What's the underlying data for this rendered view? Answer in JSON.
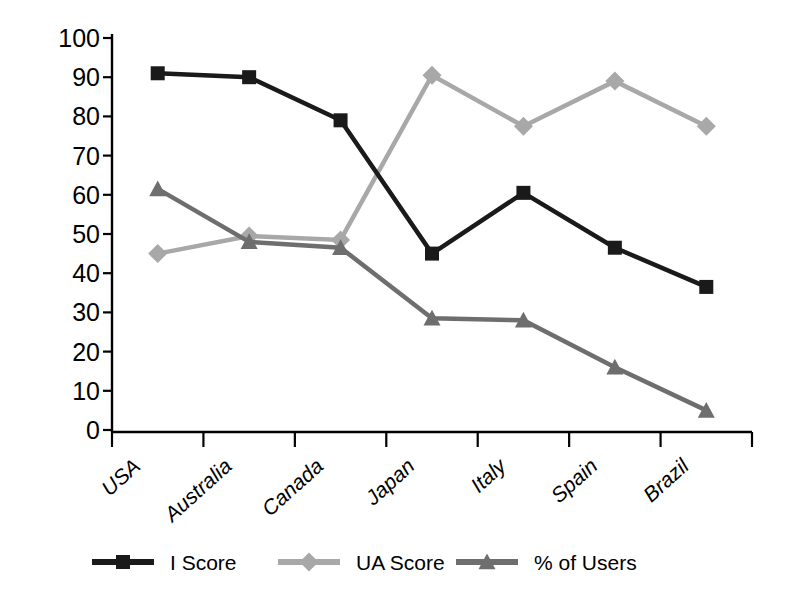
{
  "chart_data": {
    "type": "line",
    "title": "",
    "subtitle": "",
    "xlabel": "",
    "ylabel": "",
    "categories": [
      "USA",
      "Australia",
      "Canada",
      "Japan",
      "Italy",
      "Spain",
      "Brazil"
    ],
    "ylim": [
      0,
      100
    ],
    "yticks": [
      0,
      10,
      20,
      30,
      40,
      50,
      60,
      70,
      80,
      90,
      100
    ],
    "ytick_labels": [
      "0",
      "10",
      "20",
      "30",
      "40",
      "50",
      "60",
      "70",
      "80",
      "90",
      "100"
    ],
    "grid": false,
    "legend_position": "bottom",
    "series": [
      {
        "name": "I Score",
        "marker": "square",
        "color": "#1a1a1a",
        "values": [
          91,
          90,
          79,
          45,
          60.5,
          46.5,
          36.5
        ]
      },
      {
        "name": "UA Score",
        "marker": "diamond",
        "color": "#a8a8a8",
        "values": [
          45,
          49.5,
          48.5,
          90.5,
          77.5,
          89,
          77.5
        ]
      },
      {
        "name": "% of Users",
        "marker": "triangle",
        "color": "#6e6e6e",
        "values": [
          61.5,
          48,
          46.5,
          28.5,
          28,
          16,
          5
        ]
      }
    ]
  },
  "legend": {
    "items": [
      {
        "label": "I Score"
      },
      {
        "label": "UA Score"
      },
      {
        "label": "% of Users"
      }
    ]
  },
  "colors": {
    "axis": "#000000",
    "background": "#ffffff",
    "series_i_score": "#1a1a1a",
    "series_ua_score": "#a8a8a8",
    "series_pct_users": "#6e6e6e"
  }
}
